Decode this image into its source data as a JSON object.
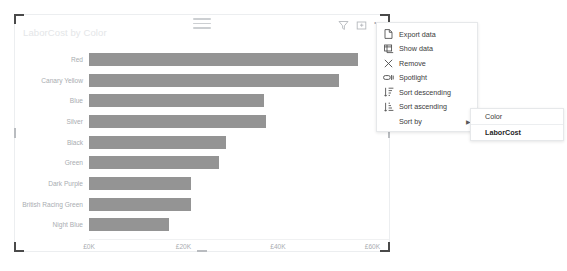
{
  "visual": {
    "title": "LaborCost by Color",
    "header_icons": [
      {
        "name": "filter-icon",
        "label": "Filters"
      },
      {
        "name": "focus-mode-icon",
        "label": "Focus mode"
      },
      {
        "name": "more-options-icon",
        "label": "More options"
      }
    ],
    "drag_handle_label": "Drag to move visual"
  },
  "context_menu": {
    "items": [
      {
        "icon": "export-data-icon",
        "label": "Export data",
        "has_submenu": false
      },
      {
        "icon": "show-data-icon",
        "label": "Show data",
        "has_submenu": false
      },
      {
        "icon": "remove-icon",
        "label": "Remove",
        "has_submenu": false
      },
      {
        "icon": "spotlight-icon",
        "label": "Spotlight",
        "has_submenu": false
      },
      {
        "icon": "sort-descending-icon",
        "label": "Sort descending",
        "has_submenu": false
      },
      {
        "icon": "sort-ascending-icon",
        "label": "Sort ascending",
        "has_submenu": false
      },
      {
        "icon": "none",
        "label": "Sort by",
        "has_submenu": true,
        "arrow": "▶"
      }
    ]
  },
  "sort_submenu": {
    "items": [
      {
        "label": "Color",
        "selected": false
      },
      {
        "label": "LaborCost",
        "selected": true
      }
    ]
  },
  "colors": {
    "bar": "#949494",
    "title_text": "#e4e6e8",
    "axis_text": "#a9adb1",
    "menu_text": "#3b3b3b",
    "menu_border": "#e6e8ea",
    "visual_border": "#eceef0",
    "handle": "#4a4a4a"
  },
  "chart_data": {
    "type": "bar",
    "orientation": "horizontal",
    "title": "LaborCost by Color",
    "xlabel": "",
    "ylabel": "",
    "xlim": [
      0,
      63500
    ],
    "grid": false,
    "legend": "none",
    "currency_symbol": "£",
    "xtick_labels": [
      "£0K",
      "£20K",
      "£40K",
      "£60K"
    ],
    "xtick_values": [
      0,
      20000,
      40000,
      60000
    ],
    "categories": [
      "Red",
      "Canary Yellow",
      "Blue",
      "Silver",
      "Black",
      "Green",
      "Dark Purple",
      "British Racing Green",
      "Night Blue"
    ],
    "values": [
      57000,
      53000,
      37000,
      37500,
      29000,
      27500,
      21500,
      21500,
      17000
    ],
    "series": [
      {
        "name": "LaborCost",
        "values": [
          57000,
          53000,
          37000,
          37500,
          29000,
          27500,
          21500,
          21500,
          17000
        ]
      }
    ]
  }
}
